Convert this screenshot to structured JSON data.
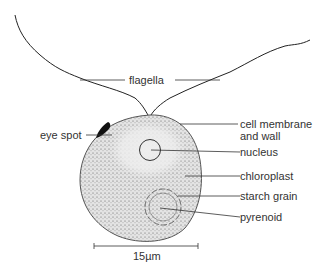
{
  "diagram": {
    "labels": {
      "flagella": "flagella",
      "eye_spot": "eye spot",
      "cell_membrane_1": "cell membrane",
      "cell_membrane_2": "and wall",
      "nucleus": "nucleus",
      "chloroplast": "chloroplast",
      "starch_grain": "starch grain",
      "pyrenoid": "pyrenoid"
    },
    "scale_bar": "15µm"
  }
}
